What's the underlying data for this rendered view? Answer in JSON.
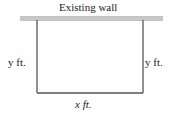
{
  "diagram": {
    "wall_label": "Existing wall",
    "left_side_label": "y ft.",
    "right_side_label": "y ft.",
    "bottom_side_label": "x ft.",
    "colors": {
      "wall": "#8a8a8a",
      "fence": "#555555",
      "text": "#222222"
    }
  }
}
